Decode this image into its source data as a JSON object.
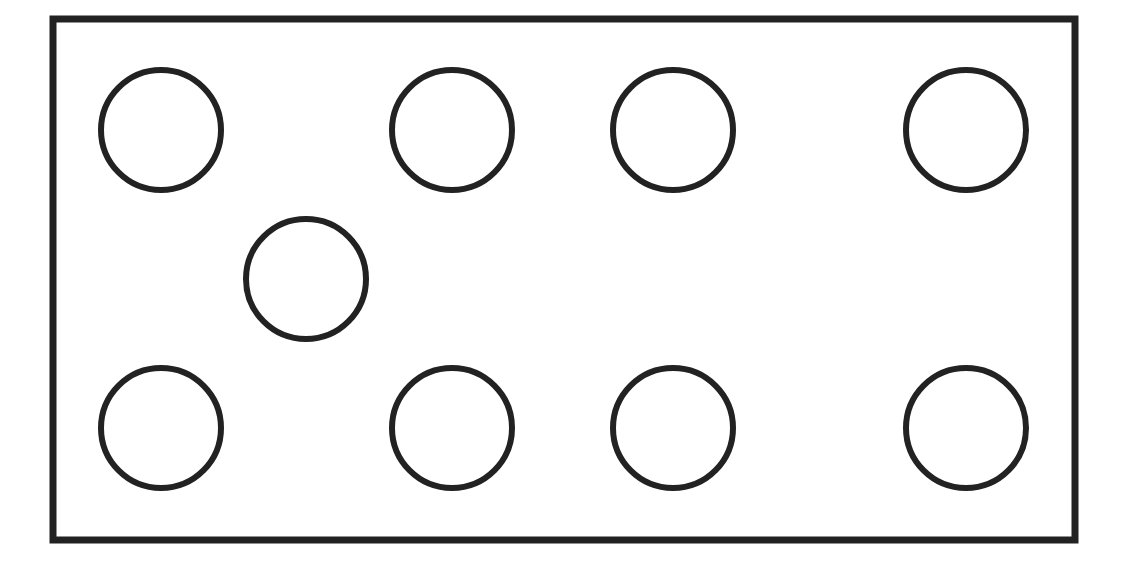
{
  "diagram": {
    "stroke_color": "#222222",
    "background_color": "#ffffff",
    "frame": {
      "x": 53,
      "y": 19,
      "width": 1022,
      "height": 521,
      "stroke_width": 7
    },
    "circle_radius": 60,
    "circle_stroke_width": 6,
    "circles": [
      {
        "id": "top-1",
        "cx": 161,
        "cy": 130
      },
      {
        "id": "top-2",
        "cx": 452,
        "cy": 130
      },
      {
        "id": "top-3",
        "cx": 673,
        "cy": 130
      },
      {
        "id": "top-4",
        "cx": 966,
        "cy": 130
      },
      {
        "id": "middle-1",
        "cx": 306,
        "cy": 279
      },
      {
        "id": "bottom-1",
        "cx": 161,
        "cy": 428
      },
      {
        "id": "bottom-2",
        "cx": 452,
        "cy": 428
      },
      {
        "id": "bottom-3",
        "cx": 673,
        "cy": 428
      },
      {
        "id": "bottom-4",
        "cx": 966,
        "cy": 428
      }
    ],
    "counts": {
      "total_circles": 9,
      "top_row": 4,
      "middle_row": 1,
      "bottom_row": 4
    }
  }
}
